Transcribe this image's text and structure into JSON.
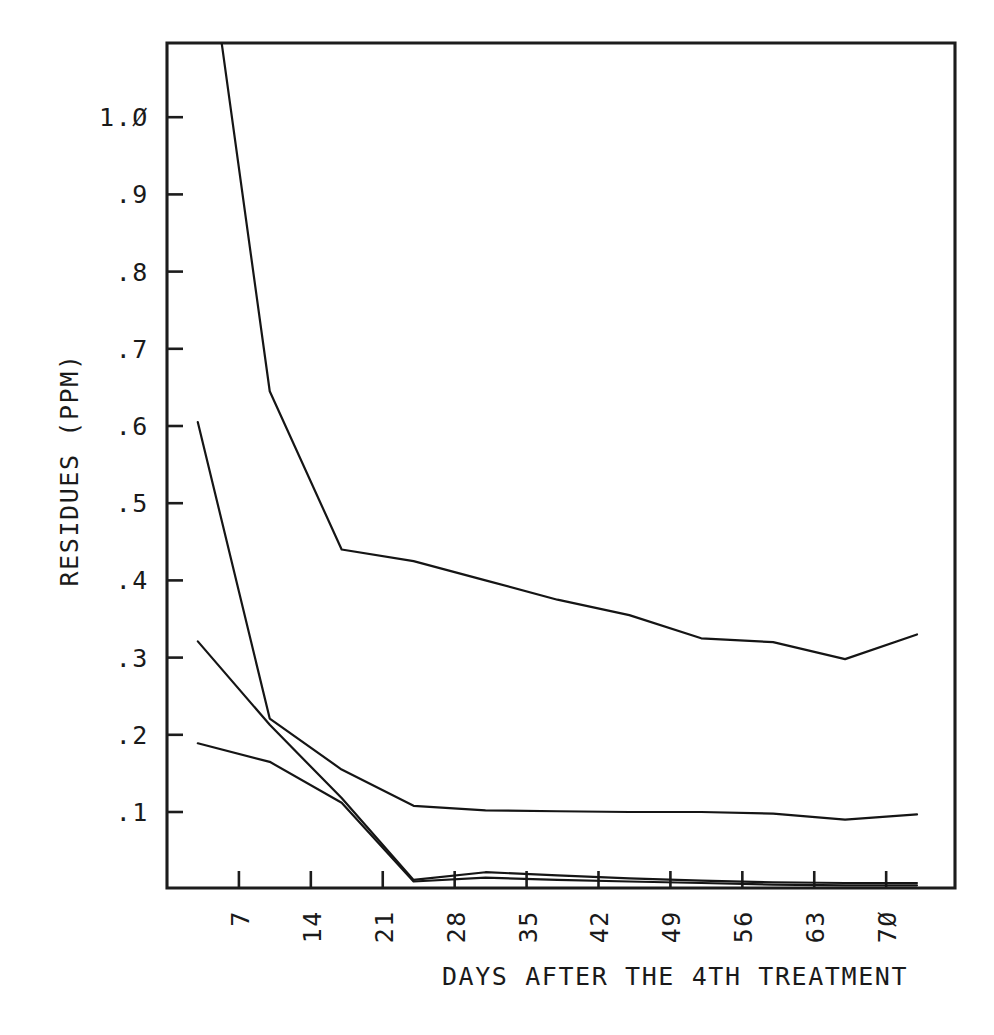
{
  "figure": {
    "background_color": "#ffffff",
    "line_color": "#151515",
    "axis_color": "#1c1c1c"
  },
  "chart_data": {
    "type": "line",
    "title": "",
    "subtitle": "",
    "xlabel": "DAYS AFTER THE 4TH TREATMENT",
    "ylabel": "RESIDUES (PPM)",
    "xlim": [
      0,
      76.7
    ],
    "ylim": [
      0,
      1.095
    ],
    "grid": false,
    "legend": "none",
    "xtick_labels": [
      "7",
      "14",
      "21",
      "28",
      "35",
      "42",
      "49",
      "56",
      "63",
      "7Ø"
    ],
    "xtick_values": [
      7,
      14,
      21,
      28,
      35,
      42,
      49,
      56,
      63,
      70
    ],
    "ytick_labels": [
      ".1",
      ".2",
      ".3",
      ".4",
      ".5",
      ".6",
      ".7",
      ".8",
      ".9",
      "1.Ø"
    ],
    "ytick_values": [
      0.1,
      0.2,
      0.3,
      0.4,
      0.5,
      0.6,
      0.7,
      0.8,
      0.9,
      1.0
    ],
    "x": [
      3,
      10,
      17,
      24,
      31,
      38,
      45,
      52,
      59,
      66,
      73
    ],
    "series": [
      {
        "name": "series-1",
        "values": [
          1.32,
          0.645,
          0.44,
          0.425,
          0.4,
          0.375,
          0.355,
          0.325,
          0.32,
          0.298,
          0.33
        ],
        "clipped_at_top": true
      },
      {
        "name": "series-2",
        "values": [
          0.605,
          0.221,
          0.155,
          0.108,
          0.102,
          0.101,
          0.1,
          0.1,
          0.098,
          0.09,
          0.097
        ]
      },
      {
        "name": "series-3",
        "values": [
          0.321,
          0.213,
          0.118,
          0.012,
          0.022,
          0.018,
          0.014,
          0.011,
          0.009,
          0.008,
          0.008
        ]
      },
      {
        "name": "series-4",
        "values": [
          0.189,
          0.165,
          0.112,
          0.01,
          0.015,
          0.012,
          0.01,
          0.008,
          0.006,
          0.005,
          0.005
        ]
      }
    ]
  }
}
